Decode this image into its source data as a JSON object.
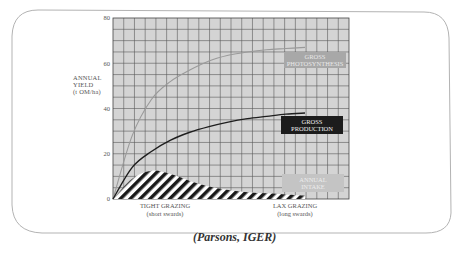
{
  "chart_data": {
    "type": "line",
    "title": "",
    "xlabel": "",
    "ylabel": "ANNUAL YIELD (t OM/ha)",
    "ylim": [
      0,
      80
    ],
    "yticks": [
      0,
      20,
      40,
      60,
      80
    ],
    "grid": true,
    "x_labels": {
      "left": "TIGHT GRAZING",
      "left_sub": "(short swards)",
      "right": "LAX GRAZING",
      "right_sub": "(long swards)"
    },
    "x": [
      0,
      1,
      2,
      3,
      4,
      5,
      6,
      7,
      8,
      9,
      10
    ],
    "series": [
      {
        "name": "GROSS PHOTOSYNTHESIS",
        "values": [
          0,
          28,
          44,
          52,
          57,
          61,
          63.5,
          65,
          66,
          66.5,
          67
        ]
      },
      {
        "name": "GROSS PRODUCTION",
        "values": [
          0,
          14,
          21,
          26,
          29.5,
          32,
          34,
          35.5,
          36.5,
          37.5,
          38
        ]
      },
      {
        "name": "ANNUAL INTAKE",
        "values": [
          0,
          9,
          12.5,
          11,
          8,
          5.5,
          4,
          3,
          2.5,
          2,
          1.5
        ]
      }
    ],
    "legend": "inline labels at right"
  },
  "axis": {
    "ylabel_line1": "ANNUAL",
    "ylabel_line2": "YIELD",
    "ylabel_line3": "(t OM/ha)",
    "ticks": [
      "80",
      "60",
      "40",
      "20",
      "0"
    ]
  },
  "labels": {
    "photosynthesis_line1": "GROSS",
    "photosynthesis_line2": "PHOTOSYNTHESIS",
    "production_line1": "GROSS",
    "production_line2": "PRODUCTION",
    "intake_line1": "ANNUAL",
    "intake_line2": "INTAKE",
    "tight": "TIGHT GRAZING",
    "tight_sub": "(short swards)",
    "lax": "LAX GRAZING",
    "lax_sub": "(long swards)"
  },
  "caption": "(Parsons, IGER)",
  "colors": {
    "plot_bg": "#d4d4d4",
    "grid": "#555555",
    "photosynthesis": "#9a9a9a",
    "production": "#1e1e1e",
    "intake_hatch": "#1a1a1a",
    "label_photo_bg": "#a8a8a8",
    "label_prod_bg": "#1c1c1c",
    "label_intake_bg": "#c4c4c4"
  }
}
